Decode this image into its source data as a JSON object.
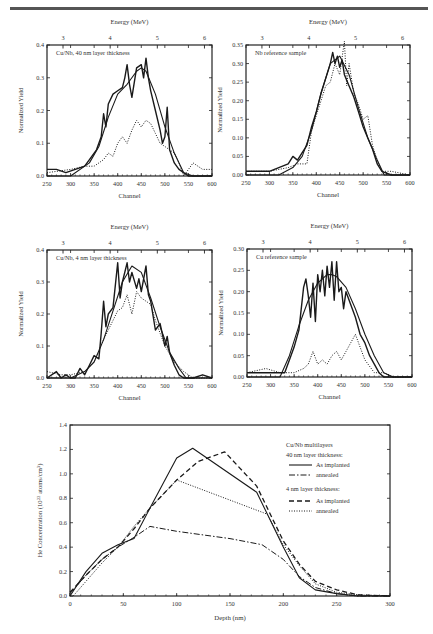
{
  "page": {
    "header_rule": true
  },
  "chart_data": [
    {
      "id": "cu-nb-40nm",
      "type": "line",
      "panel_label": "Cu/Nb, 40 nm layer thickness",
      "xlabel": "Channel",
      "ylabel": "Normalized Yield",
      "top_axis_label": "Energy (MeV)",
      "top_ticks": [
        "3",
        "4",
        "5",
        "6"
      ],
      "top_tick_positions_channel": [
        284,
        384,
        484,
        584
      ],
      "x_ticks": [
        "250",
        "300",
        "350",
        "400",
        "450",
        "500",
        "550",
        "600"
      ],
      "y_ticks": [
        "0.0",
        "0.1",
        "0.2",
        "0.3",
        "0.4"
      ],
      "xlim": [
        250,
        600
      ],
      "ylim": [
        0,
        0.4
      ],
      "series": [
        {
          "name": "measured (solid, noisy)",
          "style": "solid-thick",
          "x": [
            250,
            270,
            290,
            310,
            330,
            345,
            355,
            365,
            370,
            375,
            380,
            390,
            400,
            410,
            415,
            420,
            425,
            430,
            440,
            450,
            455,
            460,
            465,
            470,
            480,
            490,
            495,
            500,
            505,
            510,
            520,
            530,
            540,
            550,
            570,
            600
          ],
          "y": [
            0.02,
            0.02,
            0.01,
            0.02,
            0.03,
            0.06,
            0.08,
            0.12,
            0.19,
            0.15,
            0.22,
            0.25,
            0.26,
            0.27,
            0.3,
            0.34,
            0.28,
            0.24,
            0.33,
            0.34,
            0.3,
            0.36,
            0.3,
            0.26,
            0.2,
            0.14,
            0.1,
            0.12,
            0.21,
            0.08,
            0.04,
            0.02,
            0.01,
            0.0,
            0.0,
            0.0
          ]
        },
        {
          "name": "fit (smooth)",
          "style": "solid",
          "x": [
            250,
            300,
            340,
            360,
            380,
            400,
            420,
            440,
            450,
            460,
            480,
            500,
            520,
            540,
            560,
            600
          ],
          "y": [
            0.0,
            0.0,
            0.04,
            0.09,
            0.18,
            0.25,
            0.28,
            0.32,
            0.33,
            0.32,
            0.25,
            0.15,
            0.07,
            0.01,
            0.0,
            0.0
          ]
        },
        {
          "name": "annealed (dotted)",
          "style": "dotted",
          "x": [
            250,
            300,
            330,
            350,
            360,
            370,
            380,
            390,
            400,
            410,
            420,
            430,
            440,
            450,
            460,
            470,
            480,
            490,
            500,
            510,
            520,
            530,
            540,
            560,
            580,
            600
          ],
          "y": [
            0.01,
            0.02,
            0.03,
            0.03,
            0.04,
            0.05,
            0.07,
            0.06,
            0.1,
            0.12,
            0.1,
            0.14,
            0.17,
            0.15,
            0.17,
            0.16,
            0.13,
            0.1,
            0.09,
            0.08,
            0.07,
            0.04,
            0.0,
            0.04,
            0.02,
            0.02
          ]
        }
      ]
    },
    {
      "id": "nb-reference",
      "type": "line",
      "panel_label": "Nb reference sample",
      "xlabel": "Channel",
      "ylabel": "Normalized Yield",
      "top_axis_label": "Energy (MeV)",
      "top_ticks": [
        "3",
        "4",
        "5",
        "6"
      ],
      "top_tick_positions_channel": [
        284,
        384,
        484,
        584
      ],
      "x_ticks": [
        "250",
        "300",
        "350",
        "400",
        "450",
        "500",
        "550",
        "600"
      ],
      "y_ticks": [
        "0.00",
        "0.05",
        "0.10",
        "0.15",
        "0.20",
        "0.25",
        "0.30",
        "0.35"
      ],
      "xlim": [
        250,
        600
      ],
      "ylim": [
        0,
        0.35
      ],
      "series": [
        {
          "name": "measured (solid, noisy)",
          "style": "solid-thick",
          "x": [
            250,
            300,
            320,
            340,
            350,
            360,
            370,
            380,
            390,
            400,
            410,
            420,
            430,
            435,
            440,
            445,
            450,
            455,
            460,
            470,
            480,
            490,
            500,
            510,
            520,
            530,
            540,
            560,
            600
          ],
          "y": [
            0.01,
            0.01,
            0.02,
            0.03,
            0.05,
            0.04,
            0.06,
            0.08,
            0.13,
            0.17,
            0.22,
            0.26,
            0.3,
            0.33,
            0.3,
            0.32,
            0.29,
            0.31,
            0.27,
            0.24,
            0.21,
            0.17,
            0.13,
            0.1,
            0.07,
            0.03,
            0.01,
            0.0,
            0.0
          ]
        },
        {
          "name": "fit (smooth)",
          "style": "solid",
          "x": [
            250,
            320,
            350,
            370,
            390,
            410,
            430,
            450,
            470,
            490,
            510,
            530,
            545,
            560,
            600
          ],
          "y": [
            0.0,
            0.0,
            0.02,
            0.05,
            0.12,
            0.22,
            0.3,
            0.32,
            0.27,
            0.18,
            0.1,
            0.04,
            0.0,
            0.0,
            0.0
          ]
        },
        {
          "name": "annealed (dotted)",
          "style": "dotted",
          "x": [
            250,
            300,
            340,
            360,
            380,
            390,
            400,
            420,
            430,
            440,
            450,
            460,
            465,
            470,
            480,
            490,
            500,
            510,
            520,
            530,
            540,
            560,
            600
          ],
          "y": [
            0.01,
            0.01,
            0.02,
            0.03,
            0.03,
            0.12,
            0.16,
            0.24,
            0.25,
            0.3,
            0.27,
            0.36,
            0.24,
            0.3,
            0.22,
            0.19,
            0.15,
            0.16,
            0.08,
            0.04,
            0.01,
            0.01,
            0.0
          ]
        }
      ]
    },
    {
      "id": "cu-nb-4nm",
      "type": "line",
      "panel_label": "Cu/Nb, 4 nm layer thickness",
      "xlabel": "Channel",
      "ylabel": "Normalized Yield",
      "top_axis_label": "Energy (MeV)",
      "top_ticks": [
        "3",
        "4",
        "5",
        "6"
      ],
      "top_tick_positions_channel": [
        284,
        384,
        484,
        584
      ],
      "x_ticks": [
        "250",
        "300",
        "350",
        "400",
        "450",
        "500",
        "550",
        "600"
      ],
      "y_ticks": [
        "0.0",
        "0.1",
        "0.2",
        "0.3",
        "0.4"
      ],
      "xlim": [
        250,
        600
      ],
      "ylim": [
        0,
        0.4
      ],
      "series": [
        {
          "name": "measured (solid, noisy)",
          "style": "solid-thick",
          "x": [
            250,
            270,
            280,
            290,
            300,
            310,
            320,
            330,
            340,
            350,
            360,
            365,
            370,
            375,
            380,
            390,
            400,
            405,
            410,
            420,
            425,
            430,
            440,
            445,
            450,
            460,
            465,
            470,
            480,
            490,
            500,
            505,
            510,
            520,
            530,
            540,
            560,
            580,
            600
          ],
          "y": [
            0.0,
            0.02,
            0.0,
            0.01,
            0.0,
            0.0,
            0.03,
            0.01,
            0.04,
            0.07,
            0.06,
            0.14,
            0.24,
            0.16,
            0.2,
            0.22,
            0.36,
            0.25,
            0.3,
            0.36,
            0.3,
            0.33,
            0.28,
            0.31,
            0.27,
            0.35,
            0.26,
            0.24,
            0.15,
            0.17,
            0.1,
            0.13,
            0.08,
            0.04,
            0.01,
            0.0,
            0.0,
            0.01,
            0.0
          ]
        },
        {
          "name": "fit (smooth)",
          "style": "solid",
          "x": [
            250,
            300,
            330,
            350,
            370,
            390,
            410,
            430,
            450,
            470,
            490,
            510,
            530,
            545,
            560,
            600
          ],
          "y": [
            0.0,
            0.0,
            0.02,
            0.05,
            0.12,
            0.21,
            0.3,
            0.35,
            0.33,
            0.25,
            0.16,
            0.08,
            0.03,
            0.0,
            0.0,
            0.0
          ]
        },
        {
          "name": "annealed (dotted)",
          "style": "dotted",
          "x": [
            250,
            280,
            300,
            330,
            350,
            370,
            390,
            400,
            410,
            420,
            430,
            440,
            450,
            460,
            470,
            480,
            490,
            500,
            520,
            540,
            560,
            600
          ],
          "y": [
            0.02,
            0.01,
            0.01,
            0.02,
            0.05,
            0.12,
            0.18,
            0.21,
            0.22,
            0.26,
            0.2,
            0.27,
            0.25,
            0.24,
            0.23,
            0.18,
            0.14,
            0.1,
            0.05,
            0.02,
            0.0,
            0.0
          ]
        }
      ]
    },
    {
      "id": "cu-reference",
      "type": "line",
      "panel_label": "Cu reference sample",
      "xlabel": "Channel",
      "ylabel": "Normalized Yield",
      "top_axis_label": "Energy (MeV)",
      "top_ticks": [
        "3",
        "4",
        "5",
        "6"
      ],
      "top_tick_positions_channel": [
        284,
        384,
        484,
        584
      ],
      "x_ticks": [
        "250",
        "300",
        "350",
        "400",
        "450",
        "500",
        "550",
        "600"
      ],
      "y_ticks": [
        "0.00",
        "0.05",
        "0.10",
        "0.15",
        "0.20",
        "0.25",
        "0.30"
      ],
      "xlim": [
        250,
        600
      ],
      "ylim": [
        0,
        0.3
      ],
      "series": [
        {
          "name": "measured (solid, noisy)",
          "style": "solid-thick",
          "x": [
            250,
            300,
            320,
            330,
            340,
            350,
            360,
            370,
            375,
            380,
            385,
            390,
            395,
            400,
            405,
            410,
            415,
            420,
            425,
            430,
            435,
            440,
            445,
            450,
            455,
            460,
            470,
            480,
            490,
            500,
            510,
            520,
            530,
            540,
            560,
            600
          ],
          "y": [
            0.01,
            0.01,
            0.01,
            0.01,
            0.04,
            0.07,
            0.11,
            0.21,
            0.23,
            0.19,
            0.14,
            0.22,
            0.13,
            0.24,
            0.2,
            0.25,
            0.19,
            0.26,
            0.21,
            0.27,
            0.18,
            0.27,
            0.2,
            0.21,
            0.16,
            0.2,
            0.17,
            0.14,
            0.1,
            0.08,
            0.05,
            0.03,
            0.01,
            0.0,
            0.0,
            0.0
          ]
        },
        {
          "name": "fit (smooth)",
          "style": "solid",
          "x": [
            250,
            320,
            340,
            360,
            380,
            400,
            420,
            430,
            440,
            460,
            480,
            500,
            520,
            540,
            560,
            600
          ],
          "y": [
            0.0,
            0.0,
            0.05,
            0.12,
            0.18,
            0.22,
            0.24,
            0.24,
            0.235,
            0.21,
            0.16,
            0.1,
            0.05,
            0.01,
            0.0,
            0.0
          ]
        },
        {
          "name": "annealed (dotted)",
          "style": "dotted",
          "x": [
            250,
            290,
            320,
            350,
            370,
            380,
            390,
            400,
            410,
            420,
            430,
            440,
            450,
            460,
            470,
            480,
            490,
            500,
            520,
            540,
            560,
            600
          ],
          "y": [
            0.01,
            0.02,
            0.01,
            0.01,
            0.02,
            0.03,
            0.06,
            0.03,
            0.04,
            0.03,
            0.05,
            0.06,
            0.04,
            0.06,
            0.08,
            0.1,
            0.07,
            0.04,
            0.01,
            0.01,
            0.0,
            0.0
          ]
        }
      ]
    },
    {
      "id": "he-depth-profile",
      "type": "line",
      "xlabel": "Depth (nm)",
      "ylabel": "He Concentration (10^22 atoms/cm^3)",
      "ylabel_parts": {
        "pre": "He Concentration (10",
        "sup1": "22",
        "mid": " atoms/cm",
        "sup2": "3",
        "post": ")"
      },
      "x_ticks": [
        "0",
        "50",
        "100",
        "150",
        "200",
        "250",
        "300"
      ],
      "y_ticks": [
        "0.0",
        "0.2",
        "0.4",
        "0.6",
        "0.8",
        "1.0",
        "1.2",
        "1.4"
      ],
      "xlim": [
        0,
        300
      ],
      "ylim": [
        0,
        1.4
      ],
      "legend": {
        "title_lines": [
          "Cu/Nb multilayers",
          "40 nm layer thickness:"
        ],
        "group1": [
          {
            "label": "As implanted",
            "style": "solid"
          },
          {
            "label": "annealed",
            "style": "dashdot"
          }
        ],
        "group2_title": "4 nm layer thickness:",
        "group2": [
          {
            "label": "As implanted",
            "style": "dashed"
          },
          {
            "label": "annealed",
            "style": "dotted"
          }
        ],
        "position": "upper right"
      },
      "series": [
        {
          "name": "40 nm As implanted",
          "style": "solid",
          "x": [
            0,
            15,
            30,
            45,
            60,
            75,
            100,
            115,
            175,
            200,
            215,
            230,
            250,
            270,
            300
          ],
          "y": [
            0.0,
            0.2,
            0.35,
            0.42,
            0.47,
            0.72,
            1.13,
            1.21,
            0.85,
            0.4,
            0.15,
            0.05,
            0.02,
            0.0,
            0.0
          ]
        },
        {
          "name": "40 nm annealed",
          "style": "dashdot",
          "x": [
            0,
            15,
            30,
            45,
            60,
            75,
            100,
            150,
            180,
            200,
            215,
            230,
            250,
            270,
            300
          ],
          "y": [
            0.02,
            0.17,
            0.3,
            0.4,
            0.48,
            0.57,
            0.53,
            0.47,
            0.42,
            0.3,
            0.16,
            0.07,
            0.02,
            0.0,
            0.0
          ]
        },
        {
          "name": "4 nm As implanted",
          "style": "dashed",
          "x": [
            0,
            15,
            30,
            45,
            60,
            75,
            100,
            120,
            145,
            175,
            200,
            215,
            230,
            250,
            270,
            300
          ],
          "y": [
            0.03,
            0.17,
            0.3,
            0.4,
            0.55,
            0.72,
            0.95,
            1.1,
            1.18,
            0.9,
            0.45,
            0.26,
            0.12,
            0.05,
            0.01,
            0.0
          ]
        },
        {
          "name": "4 nm annealed",
          "style": "dotted",
          "x": [
            3,
            15,
            30,
            45,
            60,
            75,
            100,
            185,
            200,
            215,
            230,
            250,
            270,
            300
          ],
          "y": [
            0.0,
            0.12,
            0.27,
            0.4,
            0.57,
            0.72,
            0.95,
            0.67,
            0.42,
            0.25,
            0.1,
            0.03,
            0.01,
            0.0
          ]
        }
      ]
    }
  ]
}
